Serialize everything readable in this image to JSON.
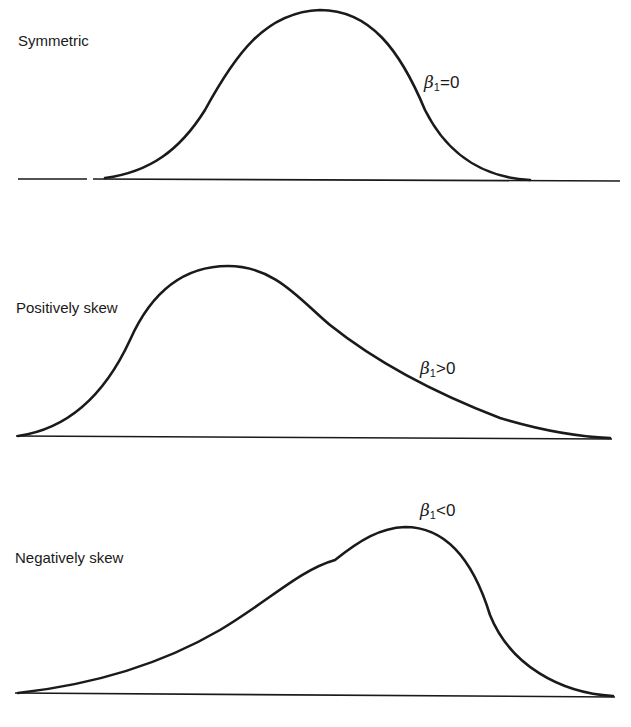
{
  "figure": {
    "panels": [
      {
        "title": "Symmetric",
        "annotation": {
          "symbol": "β",
          "subscript": "1",
          "relation": "=",
          "value": "0"
        }
      },
      {
        "title": "Positively skew",
        "annotation": {
          "symbol": "β",
          "subscript": "1",
          "relation": ">",
          "value": "0"
        }
      },
      {
        "title": "Negatively skew",
        "annotation": {
          "symbol": "β",
          "subscript": "1",
          "relation": "<",
          "value": "0"
        }
      }
    ],
    "colors": {
      "ink": "#1a1a1a",
      "background": "#ffffff"
    }
  }
}
